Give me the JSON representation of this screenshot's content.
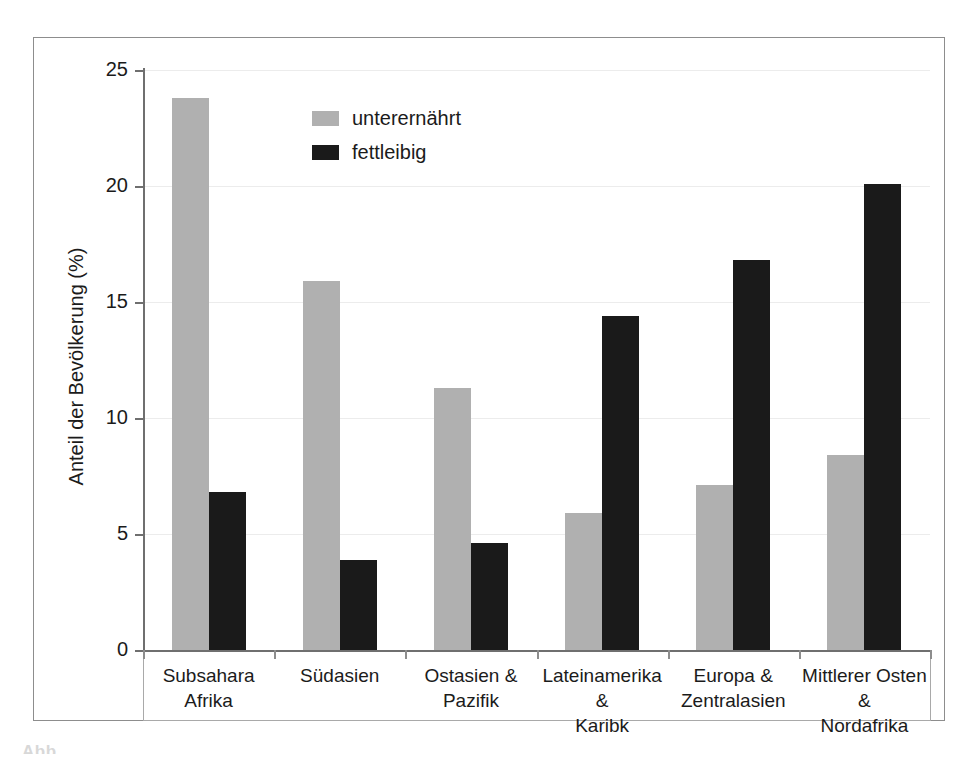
{
  "chart_data": {
    "type": "bar",
    "title": "",
    "xlabel": "",
    "ylabel": "Anteil der Bevölkerung (%)",
    "ylim": [
      0,
      25
    ],
    "yticks": [
      0,
      5,
      10,
      15,
      20,
      25
    ],
    "ytick_labels": [
      "0",
      "5",
      "10",
      "15",
      "20",
      "25"
    ],
    "grid": false,
    "legend_position": "upper-left-inside",
    "categories": [
      "Subsahara Afrika",
      "Südasien",
      "Ostasien & Pazifik",
      "Lateinamerika & Karibk",
      "Europa & Zentralasien",
      "Mittlerer Osten & Nordafrika"
    ],
    "category_lines": [
      [
        "Subsahara",
        "Afrika"
      ],
      [
        "Südasien",
        ""
      ],
      [
        "Ostasien &",
        "Pazifik"
      ],
      [
        "Lateinamerika &",
        "Karibk"
      ],
      [
        "Europa &",
        "Zentralasien"
      ],
      [
        "Mittlerer Osten &",
        "Nordafrika"
      ]
    ],
    "series": [
      {
        "name": "unterernährt",
        "color": "#b0b0b0",
        "values": [
          23.8,
          15.9,
          11.3,
          5.9,
          7.1,
          8.4
        ]
      },
      {
        "name": "fettleibig",
        "color": "#1a1a1a",
        "values": [
          6.8,
          3.9,
          4.6,
          14.4,
          16.8,
          20.1
        ]
      }
    ]
  },
  "legend": {
    "items": [
      {
        "label": "unterernährt",
        "swatch": "#b0b0b0"
      },
      {
        "label": "fettleibig",
        "swatch": "#1a1a1a"
      }
    ]
  },
  "caption": {
    "fragment": "Abb."
  }
}
